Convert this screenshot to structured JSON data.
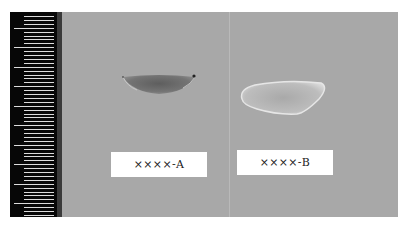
{
  "image": {
    "description": "Photograph of two seeds/grains on grey background with a measurement ruler on the left",
    "background_color": "#a8a8a8",
    "ruler": {
      "color": "#070707",
      "tick_color": "#dcdcdc",
      "major_tick_count": 10
    },
    "samples": [
      {
        "id": "A",
        "label": "××××-A",
        "appearance": "dark grey, elongated crescent/boat shape"
      },
      {
        "id": "B",
        "label": "××××-B",
        "appearance": "pale whitish, rounded triangular shape"
      }
    ]
  }
}
